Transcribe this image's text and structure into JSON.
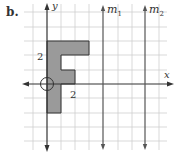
{
  "part_label": "b.",
  "axes": {
    "x_label": "x",
    "y_label": "y"
  },
  "tick_labels": {
    "y_tick": "2",
    "x_tick": "2"
  },
  "mirror_lines": [
    {
      "name": "m",
      "subscript": "1",
      "x_units": 4
    },
    {
      "name": "m",
      "subscript": "2",
      "x_units": 7
    }
  ],
  "figure": {
    "letter": "F",
    "fill": "#9a9a9a",
    "stroke": "#333333"
  },
  "colors": {
    "grid": "#c8c8c8",
    "axis": "#333333"
  }
}
